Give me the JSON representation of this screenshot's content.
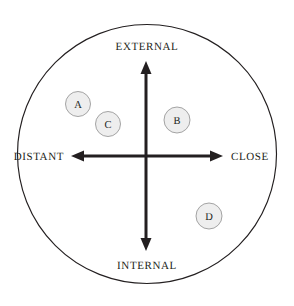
{
  "figure": {
    "type": "quadrant-map",
    "background_color": "#ffffff",
    "outer_circle": {
      "name": "boundary-circle",
      "center_x": 147,
      "center_y": 154,
      "radius": 130,
      "stroke_color": "#231f20",
      "fill_color": "#ffffff"
    },
    "axes": {
      "vertical": {
        "name": "external-internal-axis",
        "x": 146,
        "top_y": 62,
        "bottom_y": 250,
        "color": "#231f20",
        "double_headed": true
      },
      "horizontal": {
        "name": "distant-close-axis",
        "y": 156,
        "left_x": 72,
        "right_x": 222,
        "color": "#231f20",
        "double_headed": true
      }
    },
    "labels": {
      "top": "EXTERNAL",
      "bottom": "INTERNAL",
      "left": "DISTANT",
      "right": "CLOSE"
    },
    "nodes": [
      {
        "id": "node-a",
        "label": "A",
        "cx": 78,
        "cy": 104,
        "r": 12.5,
        "fill_color": "#eeeeee",
        "stroke_color": "#9a9a9a"
      },
      {
        "id": "node-c",
        "label": "C",
        "cx": 108,
        "cy": 124,
        "r": 12.5,
        "fill_color": "#eeeeee",
        "stroke_color": "#9a9a9a"
      },
      {
        "id": "node-b",
        "label": "B",
        "cx": 177,
        "cy": 120,
        "r": 13,
        "fill_color": "#eeeeee",
        "stroke_color": "#9a9a9a"
      },
      {
        "id": "node-d",
        "label": "D",
        "cx": 209,
        "cy": 216,
        "r": 13,
        "fill_color": "#eeeeee",
        "stroke_color": "#9a9a9a"
      }
    ]
  }
}
